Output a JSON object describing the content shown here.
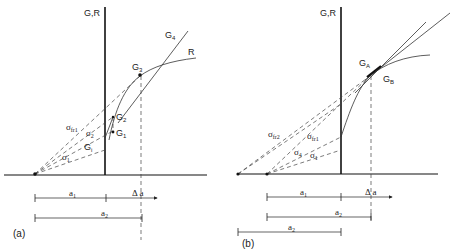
{
  "panels": [
    {
      "id": "a",
      "label": "(a)",
      "axis_label": "G,R",
      "curve_labels": {
        "G4": "G",
        "G4_sub": "4",
        "R": "R",
        "G3": "G",
        "G3_sub": "3",
        "G2": "G",
        "G2_sub": "2",
        "G1": "G",
        "G1_sub": "1",
        "Gi": "G",
        "Gi_sub": "i"
      },
      "stress_labels": {
        "sfr1": "σ",
        "sfr1_sub": "fr1",
        "s2": "σ",
        "s2_sub": "2",
        "s1": "σ",
        "s1_sub": "1"
      },
      "dimensions": {
        "a1": "a",
        "a1_sub": "1",
        "delta_a": "Δ a",
        "a2": "a",
        "a2_sub": "2"
      }
    },
    {
      "id": "b",
      "label": "(b)",
      "axis_label": "G,R",
      "curve_labels": {
        "GA": "G",
        "GA_sub": "A",
        "GB": "G",
        "GB_sub": "B"
      },
      "stress_labels": {
        "sfr2": "σ",
        "sfr2_sub": "fr2",
        "sfr1": "σ",
        "sfr1_sub": "fr1",
        "s4": "σ",
        "s4_sub": "4",
        "s1": "σ",
        "s1_sub": "1"
      },
      "dimensions": {
        "a1": "a",
        "a1_sub": "1",
        "delta_a": "Δ a",
        "a2": "a",
        "a2_sub": "2",
        "a2b": "a",
        "a2b_sub": "2"
      }
    }
  ]
}
